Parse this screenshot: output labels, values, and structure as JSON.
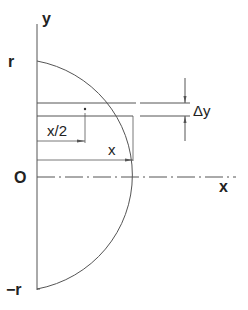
{
  "diagram": {
    "colors": {
      "line": "#555555",
      "text": "#222222",
      "background": "#ffffff"
    },
    "labels": {
      "y_axis": "y",
      "x_axis": "x",
      "origin": "O",
      "top": "r",
      "bottom": "−r",
      "strip_height": "Δy",
      "half_width": "x/2",
      "width": "x"
    },
    "geometry": {
      "shape": "right half-disc (semicircle) of radius r",
      "strip": "horizontal strip of thickness Δy at height y, width x",
      "centroid_marker": "dot at x/2 on strip"
    }
  }
}
